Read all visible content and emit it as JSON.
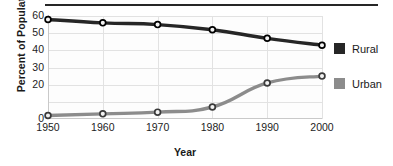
{
  "chart_data": {
    "type": "line",
    "title": "",
    "xlabel": "Year",
    "ylabel": "Percent of Population",
    "x": [
      1950,
      1960,
      1970,
      1980,
      1990,
      2000
    ],
    "xticklabels": [
      "1950",
      "1960",
      "1970",
      "1980",
      "1990",
      "2000"
    ],
    "yticks": [
      0,
      20,
      30,
      40,
      50,
      60
    ],
    "yticklabels": [
      "0",
      "20",
      "30",
      "40",
      "50",
      "60"
    ],
    "ylim": [
      0,
      60
    ],
    "xlim": [
      1950,
      2000
    ],
    "grid": true,
    "legend_position": "right",
    "series": [
      {
        "name": "Rural",
        "color": "#262626",
        "values": [
          58,
          56,
          55,
          52,
          47,
          43
        ]
      },
      {
        "name": "Urban",
        "color": "#8c8c8c",
        "values": [
          2,
          3,
          4,
          7,
          21,
          25
        ]
      }
    ]
  },
  "legend": {
    "items": [
      {
        "label": "Rural",
        "color": "#262626"
      },
      {
        "label": "Urban",
        "color": "#8c8c8c"
      }
    ]
  },
  "colors": {
    "rural": "#262626",
    "urban": "#8c8c8c",
    "grid": "#e2e2e2",
    "axis": "#c9c9c9",
    "text": "#1a1a1a",
    "rule": "#262626"
  }
}
